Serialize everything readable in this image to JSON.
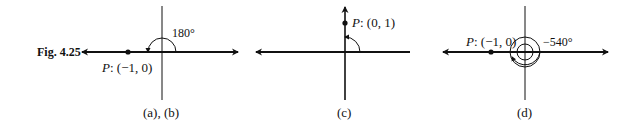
{
  "figure": {
    "number": "Fig. 4.25",
    "panels": [
      {
        "id": "ab",
        "caption": "(a), (b)",
        "point_name": "P",
        "point_coords": ": (−1, 0)",
        "angle_label": "180°"
      },
      {
        "id": "c",
        "caption": "(c)",
        "point_name": "P",
        "point_coords": ": (0, 1)",
        "angle_label": ""
      },
      {
        "id": "d",
        "caption": "(d)",
        "point_name": "P",
        "point_coords": ": (−1, 0)",
        "angle_label": "−540°"
      }
    ]
  },
  "colors": {
    "ink": "#111111",
    "background": "#ffffff"
  }
}
